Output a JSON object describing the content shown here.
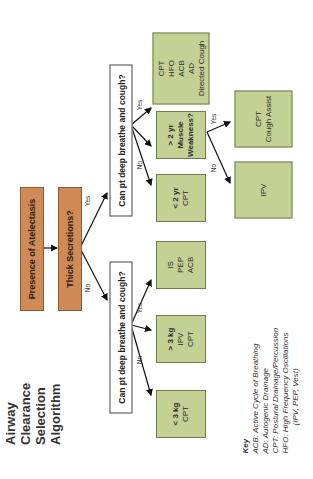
{
  "title": {
    "line1": "Airway Clearance",
    "line2": "Selection Algorithm"
  },
  "nodes": {
    "presence": "Presence of Atelectasis",
    "thick": "Thick Secretions?",
    "q_yes": "Can pt deep breathe and cough?",
    "q_no": "Can pt deep breathe and cough?",
    "yes_yes": [
      "CPT",
      "HFO",
      "ACB",
      "AD",
      "Directed Cough"
    ],
    "gt2yr": {
      "head": "> 2 yr",
      "sub1": "Muscle",
      "sub2": "Weakness?"
    },
    "lt2yr": {
      "head": "< 2 yr",
      "sub": "CPT"
    },
    "cough_assist": {
      "l1": "CPT",
      "l2": "Cough Assist"
    },
    "ipv": "IPV",
    "is_pep": [
      "IS",
      "PEP",
      "ACB"
    ],
    "gt3kg": {
      "head": "> 3 kg",
      "l1": "IPV",
      "l2": "CPT"
    },
    "lt3kg": {
      "head": "< 3 kg",
      "l1": "CPT"
    }
  },
  "labels": {
    "yes": "Yes",
    "no": "No"
  },
  "key": {
    "heading": "Key",
    "items": [
      "ACB:  Active Cycle of Breathing",
      "AD:  Autogenic Drainage",
      "CPT:  Postural Drainage/Percussion",
      "HFO:  High Frequency Oscillations",
      "(IPV, PEP, Vest)"
    ]
  },
  "colors": {
    "orange": "#d08a55",
    "green": "#c3d195"
  }
}
